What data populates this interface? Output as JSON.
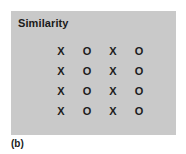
{
  "figure": {
    "caption": "(b)",
    "panel": {
      "title": "Similarity",
      "background_color": "#c9c9c9",
      "text_color": "#1c1c1c"
    }
  },
  "chart_data": {
    "type": "table",
    "title": "Similarity",
    "xlabel": "",
    "ylabel": "",
    "grid": false,
    "rows": 4,
    "columns": 4,
    "cells": [
      [
        "X",
        "O",
        "X",
        "O"
      ],
      [
        "X",
        "O",
        "X",
        "O"
      ],
      [
        "X",
        "O",
        "X",
        "O"
      ],
      [
        "X",
        "O",
        "X",
        "O"
      ]
    ],
    "annotations": [
      "(b)"
    ]
  }
}
